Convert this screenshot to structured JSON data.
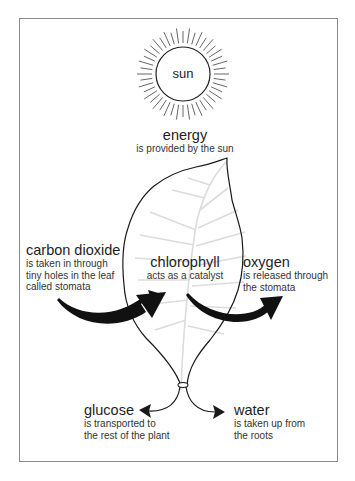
{
  "diagram": {
    "type": "photosynthesis",
    "sun": {
      "label": "sun"
    },
    "energy": {
      "title": "energy",
      "desc": [
        "is provided by the sun"
      ]
    },
    "carbon_dioxide": {
      "title": "carbon dioxide",
      "desc": [
        "is taken in through",
        "tiny holes in the leaf",
        "called stomata"
      ]
    },
    "chlorophyll": {
      "title": "chlorophyll",
      "desc": [
        "acts as a catalyst"
      ]
    },
    "oxygen": {
      "title": "oxygen",
      "desc": [
        "is released through",
        "the stomata"
      ]
    },
    "glucose": {
      "title": "glucose",
      "desc": [
        "is transported to",
        "the rest of the plant"
      ]
    },
    "water": {
      "title": "water",
      "desc": [
        "is taken up from",
        "the roots"
      ]
    },
    "colors": {
      "outline": "#1a1a1a",
      "veins": "#d8d8d8",
      "frame": "#8a8a8a",
      "rays": "#555555"
    }
  }
}
